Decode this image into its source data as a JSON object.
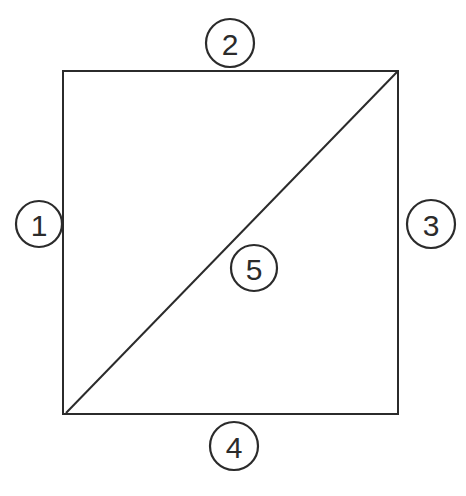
{
  "figure": {
    "background_color": "#ffffff",
    "stroke_color": "#2b2b2b",
    "canvas": {
      "width": 466,
      "height": 496
    }
  },
  "shape": {
    "type": "square",
    "top_left": {
      "x": 63,
      "y": 71
    },
    "bottom_right": {
      "x": 398,
      "y": 414
    },
    "width": 335,
    "height": 343,
    "edge_stroke_width": 2.4
  },
  "diagonal": {
    "from": {
      "x": 66,
      "y": 413
    },
    "to": {
      "x": 397,
      "y": 72
    },
    "stroke_width": 2.0
  },
  "callouts": [
    {
      "id": "callout-1",
      "label": "1",
      "position": "left",
      "cx": 39,
      "cy": 224,
      "r": 24,
      "refers_to": "left edge"
    },
    {
      "id": "callout-2",
      "label": "2",
      "position": "top",
      "cx": 230,
      "cy": 43,
      "r": 24,
      "refers_to": "top edge"
    },
    {
      "id": "callout-3",
      "label": "3",
      "position": "right",
      "cx": 431,
      "cy": 224,
      "r": 25,
      "refers_to": "right edge"
    },
    {
      "id": "callout-4",
      "label": "4",
      "position": "bottom",
      "cx": 234,
      "cy": 446,
      "r": 24,
      "refers_to": "bottom edge"
    },
    {
      "id": "callout-5",
      "label": "5",
      "position": "center",
      "cx": 254,
      "cy": 268,
      "r": 24,
      "refers_to": "diagonal"
    }
  ]
}
